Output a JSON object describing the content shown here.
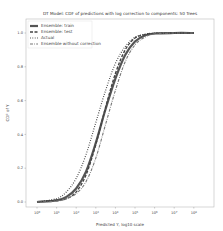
{
  "chart_data": {
    "type": "line",
    "title": "DT Model: CDF of predictions with log correction to components: 50 Trees",
    "xlabel": "Predicted Y, log10 scale",
    "ylabel": "CDF of Y",
    "x_scale": "log",
    "xlim": [
      0.5,
      300000000
    ],
    "ylim": [
      0.0,
      1.0
    ],
    "x_tick_labels": [
      "10^0",
      "10^1",
      "10^2",
      "10^3",
      "10^4",
      "10^5",
      "10^6",
      "10^7",
      "10^8"
    ],
    "y_tick_labels": [
      "0.0",
      "0.2",
      "0.4",
      "0.6",
      "0.8",
      "1.0"
    ],
    "grid": false,
    "legend_position": "upper left",
    "series": [
      {
        "name": "Ensemble: train",
        "style": "solid",
        "color": "#555555",
        "x_log10": [
          0,
          1,
          1.5,
          2,
          2.5,
          3,
          3.5,
          4,
          4.5,
          5,
          5.5,
          6,
          7,
          8
        ],
        "values": [
          0.0,
          0.01,
          0.03,
          0.08,
          0.18,
          0.35,
          0.55,
          0.73,
          0.87,
          0.95,
          0.985,
          0.997,
          1.0,
          1.0
        ]
      },
      {
        "name": "Ensemble: test",
        "style": "dashed",
        "color": "#444444",
        "x_log10": [
          0,
          1,
          1.5,
          2,
          2.5,
          3,
          3.5,
          4,
          4.5,
          5,
          5.5,
          6,
          7,
          8
        ],
        "values": [
          0.0,
          0.01,
          0.02,
          0.06,
          0.16,
          0.34,
          0.56,
          0.76,
          0.9,
          0.97,
          0.99,
          0.998,
          1.0,
          1.0
        ]
      },
      {
        "name": "Actual",
        "style": "dotted",
        "color": "#333333",
        "x_log10": [
          0,
          1,
          1.5,
          2,
          2.5,
          3,
          3.5,
          4,
          4.5,
          5,
          5.5,
          6,
          7,
          8
        ],
        "values": [
          0.0,
          0.02,
          0.06,
          0.14,
          0.28,
          0.47,
          0.66,
          0.82,
          0.92,
          0.975,
          0.993,
          0.999,
          1.0,
          1.0
        ]
      },
      {
        "name": "Ensemble without correction",
        "style": "dashdot",
        "color": "#777777",
        "x_log10": [
          0,
          1,
          1.5,
          2,
          2.5,
          3,
          3.5,
          4,
          4.5,
          5,
          5.5,
          6,
          7,
          8
        ],
        "values": [
          0.0,
          0.005,
          0.02,
          0.05,
          0.12,
          0.26,
          0.46,
          0.66,
          0.83,
          0.93,
          0.975,
          0.995,
          1.0,
          1.0
        ]
      }
    ]
  }
}
